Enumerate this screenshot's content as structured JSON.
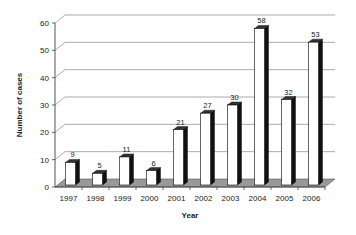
{
  "chart_data": {
    "type": "bar",
    "title": "",
    "xlabel": "Year",
    "ylabel": "Number of cases",
    "categories": [
      "1997",
      "1998",
      "1999",
      "2000",
      "2001",
      "2002",
      "2003",
      "2004",
      "2005",
      "2006"
    ],
    "values": [
      9,
      5,
      11,
      6,
      21,
      27,
      30,
      58,
      32,
      53
    ],
    "data_labels": [
      "9",
      "5",
      "11",
      "6",
      "21",
      "27",
      "30",
      "58",
      "32",
      "53"
    ],
    "ylim": [
      0,
      60
    ],
    "yticks": [
      0,
      10,
      20,
      30,
      40,
      50,
      60
    ],
    "grid": true,
    "style": "3d",
    "legend": null
  },
  "colors": {
    "bar_front": "#ffffff",
    "bar_side": "#111111",
    "bar_top": "#333333",
    "floor": "#999999",
    "grid": "#888888",
    "axis": "#444444"
  }
}
